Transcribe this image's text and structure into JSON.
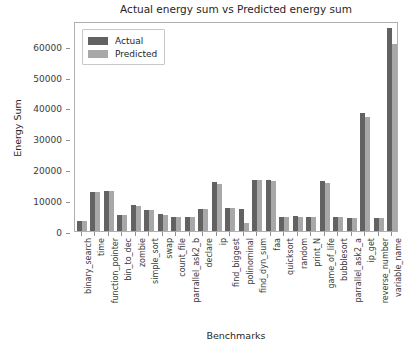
{
  "chart_data": {
    "type": "bar",
    "title": "Actual energy sum vs Predicted energy sum",
    "xlabel": "Benchmarks",
    "ylabel": "Energy Sum",
    "ylim": [
      0,
      68000
    ],
    "yticks": [
      0,
      10000,
      20000,
      30000,
      40000,
      50000,
      60000
    ],
    "ytick_labels": [
      "0",
      "10000",
      "20000",
      "30000",
      "40000",
      "50000",
      "60000"
    ],
    "grid": false,
    "legend_position": "upper left",
    "categories": [
      "binary_search",
      "time",
      "function_pointer",
      "bin_to_dec",
      "zombie",
      "simple_sort",
      "swap",
      "count_file",
      "parrallel_ask2_b",
      "declare",
      "ip",
      "find_biggest",
      "polinominal",
      "find_dyn_sum",
      "faa",
      "quicksort",
      "random",
      "print_N",
      "game_of_life",
      "bubblesort",
      "parrallel_ask2_a",
      "ip_get",
      "reverse_number",
      "variable_name"
    ],
    "series": [
      {
        "name": "Actual",
        "color": "#626262",
        "values": [
          3300,
          12600,
          13000,
          5100,
          8300,
          6900,
          5400,
          4400,
          4500,
          7200,
          15800,
          7600,
          7000,
          16600,
          16600,
          4700,
          4800,
          4700,
          16100,
          4700,
          4200,
          38300,
          4300,
          65800
        ]
      },
      {
        "name": "Predicted",
        "color": "#a8a8a8",
        "values": [
          3300,
          12500,
          12900,
          5100,
          8000,
          6700,
          5200,
          4400,
          4500,
          7100,
          15100,
          7400,
          2500,
          16400,
          16300,
          4600,
          4700,
          4700,
          15600,
          4600,
          4200,
          36900,
          4300,
          60700
        ]
      }
    ]
  },
  "legend": {
    "items": [
      {
        "label": "Actual",
        "color": "#626262"
      },
      {
        "label": "Predicted",
        "color": "#a8a8a8"
      }
    ]
  }
}
